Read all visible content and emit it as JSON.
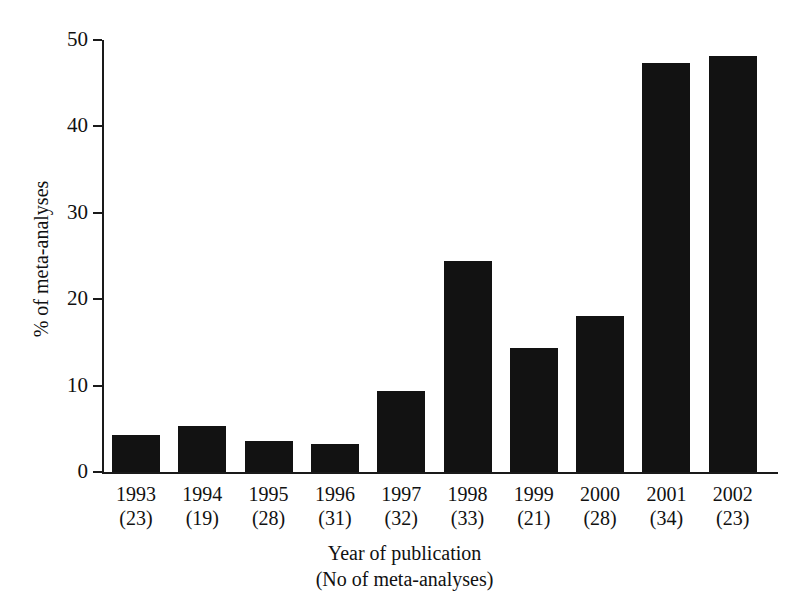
{
  "chart_data": {
    "type": "bar",
    "title": "",
    "xlabel": "Year of publication",
    "xlabel_line2": "(No of meta-analyses)",
    "ylabel": "% of meta-analyses",
    "ylim": [
      0,
      50
    ],
    "yticks": [
      0,
      10,
      20,
      30,
      40,
      50
    ],
    "grid": false,
    "legend": "none",
    "bar_color": "#121212",
    "axis_color": "#1a1a1a",
    "categories": [
      "1993",
      "1994",
      "1995",
      "1996",
      "1997",
      "1998",
      "1999",
      "2000",
      "2001",
      "2002"
    ],
    "counts": [
      23,
      19,
      28,
      31,
      32,
      33,
      21,
      28,
      34,
      23
    ],
    "values": [
      4.3,
      5.3,
      3.6,
      3.2,
      9.4,
      24.4,
      14.3,
      18.0,
      47.3,
      48.1
    ],
    "points": [
      {
        "category": "1993",
        "count": 23,
        "value": 4.3
      },
      {
        "category": "1994",
        "count": 19,
        "value": 5.3
      },
      {
        "category": "1995",
        "count": 28,
        "value": 3.6
      },
      {
        "category": "1996",
        "count": 31,
        "value": 3.2
      },
      {
        "category": "1997",
        "count": 32,
        "value": 9.4
      },
      {
        "category": "1998",
        "count": 33,
        "value": 24.4
      },
      {
        "category": "1999",
        "count": 21,
        "value": 14.3
      },
      {
        "category": "2000",
        "count": 28,
        "value": 18.0
      },
      {
        "category": "2001",
        "count": 34,
        "value": 47.3
      },
      {
        "category": "2002",
        "count": 23,
        "value": 48.1
      }
    ],
    "tick_labels": [
      "0",
      "10",
      "20",
      "30",
      "40",
      "50"
    ],
    "x_tick_labels": [
      {
        "year": "1993",
        "count": "(23)"
      },
      {
        "year": "1994",
        "count": "(19)"
      },
      {
        "year": "1995",
        "count": "(28)"
      },
      {
        "year": "1996",
        "count": "(31)"
      },
      {
        "year": "1997",
        "count": "(32)"
      },
      {
        "year": "1998",
        "count": "(33)"
      },
      {
        "year": "1999",
        "count": "(21)"
      },
      {
        "year": "2000",
        "count": "(28)"
      },
      {
        "year": "2001",
        "count": "(34)"
      },
      {
        "year": "2002",
        "count": "(23)"
      }
    ]
  }
}
